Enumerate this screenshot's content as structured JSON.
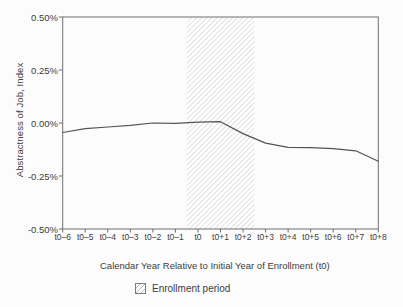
{
  "figure": {
    "legend": {
      "label": "Enrollment period",
      "swatch": "diagonal-hatch-square"
    }
  },
  "chart_data": {
    "type": "line",
    "title": "",
    "xlabel": "Calendar Year Relative to Initial Year of Enrollment (t0)",
    "ylabel": "Abstractness of Job, Index",
    "categories": [
      "t0–6",
      "t0–5",
      "t0–4",
      "t0–3",
      "t0–2",
      "t0–1",
      "t0",
      "t0+1",
      "t0+2",
      "t0+3",
      "t0+4",
      "t0+5",
      "t0+6",
      "t0+7",
      "t0+8"
    ],
    "y_ticks": [
      "0.50%",
      "0.25%",
      "0.00%",
      "-0.25%",
      "-0.50%"
    ],
    "y_tick_values": [
      0.5,
      0.25,
      0.0,
      -0.25,
      -0.5
    ],
    "ylim": [
      -0.5,
      0.5
    ],
    "grid": false,
    "legend_position": "bottom",
    "series": [
      {
        "name": "Abstractness of Job, Index",
        "values": [
          -0.045,
          -0.027,
          -0.019,
          -0.011,
          0.0,
          -0.002,
          0.004,
          0.006,
          -0.05,
          -0.095,
          -0.115,
          -0.116,
          -0.121,
          -0.131,
          -0.18
        ]
      }
    ],
    "shaded_region": {
      "label": "Enrollment period",
      "from_category": "t0",
      "to_category": "t0+2",
      "style": "diagonal-hatch"
    }
  },
  "colors": {
    "line": "#545454",
    "border": "#6e6e6e",
    "tick": "#6e6e6e",
    "hatch": "#c8c8c8",
    "text": "#3d3d3d",
    "background": "#fcfcfc"
  }
}
